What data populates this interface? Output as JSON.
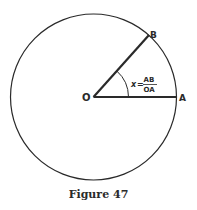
{
  "figure": {
    "caption": "Figure 47",
    "circle": {
      "cx": 93.5,
      "cy": 97,
      "r": 83
    },
    "points": {
      "O": {
        "label": "O",
        "x": 93.5,
        "y": 97
      },
      "A": {
        "label": "A",
        "x": 176.5,
        "y": 97
      },
      "B": {
        "label": "B",
        "x": 149,
        "y": 35
      }
    },
    "angle_label": {
      "variable": "x",
      "equals": "=",
      "numerator": "AB",
      "denominator": "OA"
    },
    "colors": {
      "stroke": "#2a2a2a",
      "background": "#ffffff"
    }
  }
}
